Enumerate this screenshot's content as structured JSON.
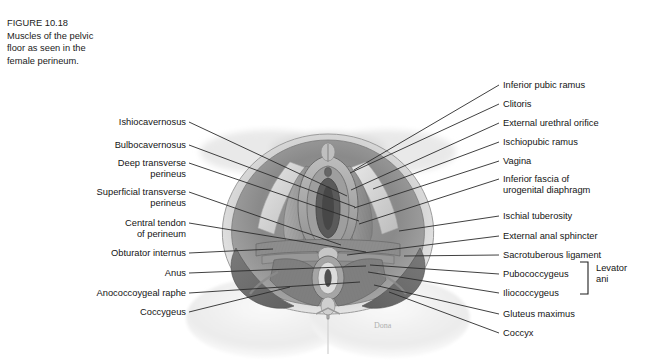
{
  "figure": {
    "caption_lines": [
      "FIGURE 10.18",
      "Muscles of the pelvic",
      "floor as seen in the",
      "female perineum."
    ],
    "signature": "Dona"
  },
  "labels_left": [
    {
      "id": "ishiocavernosus",
      "line1": "Ishiocavernosus",
      "line2": "",
      "x": 186,
      "y": 117,
      "tip_x": 347,
      "tip_y": 196
    },
    {
      "id": "bulbocavernosus",
      "line1": "Bulbocavernosus",
      "line2": "",
      "x": 186,
      "y": 140,
      "tip_x": 355,
      "tip_y": 207
    },
    {
      "id": "deep-transverse-perineus",
      "line1": "Deep transverse",
      "line2": "perineus",
      "x": 186,
      "y": 158,
      "tip_x": 359,
      "tip_y": 221
    },
    {
      "id": "superficial-transverse-perineus",
      "line1": "Superficial transverse",
      "line2": "perineus",
      "x": 186,
      "y": 187,
      "tip_x": 341,
      "tip_y": 245
    },
    {
      "id": "central-tendon-of-perineum",
      "line1": "Central tendon",
      "line2": "of perineum",
      "x": 186,
      "y": 218,
      "tip_x": 366,
      "tip_y": 252
    },
    {
      "id": "obturator-internus",
      "line1": "Obturator internus",
      "line2": "",
      "x": 186,
      "y": 248,
      "tip_x": 273,
      "tip_y": 249
    },
    {
      "id": "anus",
      "line1": "Anus",
      "line2": "",
      "x": 186,
      "y": 268,
      "tip_x": 366,
      "tip_y": 266
    },
    {
      "id": "anococcoygeal-raphe",
      "line1": "Anococcoygeal raphe",
      "line2": "",
      "x": 186,
      "y": 288,
      "tip_x": 360,
      "tip_y": 282
    },
    {
      "id": "coccygeus",
      "line1": "Coccygeus",
      "line2": "",
      "x": 186,
      "y": 307,
      "tip_x": 290,
      "tip_y": 287
    }
  ],
  "labels_right": [
    {
      "id": "inferior-pubic-ramus",
      "line1": "Inferior pubic ramus",
      "line2": "",
      "x": 503,
      "y": 80,
      "tip_x": 354,
      "tip_y": 170
    },
    {
      "id": "clitoris",
      "line1": "Clitoris",
      "line2": "",
      "x": 503,
      "y": 99,
      "tip_x": 350,
      "tip_y": 173
    },
    {
      "id": "external-urethral-orifice",
      "line1": "External urethral orifice",
      "line2": "",
      "x": 503,
      "y": 118,
      "tip_x": 351,
      "tip_y": 190
    },
    {
      "id": "ischiopubic-ramus",
      "line1": "Ischiopubic ramus",
      "line2": "",
      "x": 503,
      "y": 137,
      "tip_x": 373,
      "tip_y": 189
    },
    {
      "id": "vagina",
      "line1": "Vagina",
      "line2": "",
      "x": 503,
      "y": 156,
      "tip_x": 354,
      "tip_y": 208
    },
    {
      "id": "inferior-fascia-of-urogenital-diaphragm",
      "line1": "Inferior fascia of",
      "line2": "urogenital diaphragm",
      "x": 503,
      "y": 174,
      "tip_x": 359,
      "tip_y": 224
    },
    {
      "id": "ischial-tuberosity",
      "line1": "Ischial tuberosity",
      "line2": "",
      "x": 503,
      "y": 211,
      "tip_x": 399,
      "tip_y": 231
    },
    {
      "id": "external-anal-sphincter",
      "line1": "External anal sphincter",
      "line2": "",
      "x": 503,
      "y": 231,
      "tip_x": 347,
      "tip_y": 255
    },
    {
      "id": "sacrotuberous-ligament",
      "line1": "Sacrotuberous ligament",
      "line2": "",
      "x": 503,
      "y": 250,
      "tip_x": 404,
      "tip_y": 256
    },
    {
      "id": "pubococcygeus",
      "line1": "Pubococcygeus",
      "line2": "",
      "x": 503,
      "y": 269,
      "tip_x": 370,
      "tip_y": 265
    },
    {
      "id": "iliococcygeus",
      "line1": "Iliococcygeus",
      "line2": "",
      "x": 503,
      "y": 288,
      "tip_x": 368,
      "tip_y": 272
    },
    {
      "id": "gluteus-maximus",
      "line1": "Gluteus maximus",
      "line2": "",
      "x": 503,
      "y": 309,
      "tip_x": 374,
      "tip_y": 285
    },
    {
      "id": "coccyx",
      "line1": "Coccyx",
      "line2": "",
      "x": 503,
      "y": 328,
      "tip_x": 389,
      "tip_y": 292
    }
  ],
  "bracket_group": {
    "label_line1": "Levator",
    "label_line2": "ani",
    "members": [
      "Pubococcygeus",
      "Iliococcygeus"
    ]
  },
  "colors": {
    "background": "#ffffff",
    "text": "#141414",
    "leader_line": "#2b2b2b",
    "art_light": "#f2f2f2",
    "art_mid": "#b9b9b9",
    "art_dark": "#6e6e6e",
    "art_deep": "#4a4a4a"
  }
}
